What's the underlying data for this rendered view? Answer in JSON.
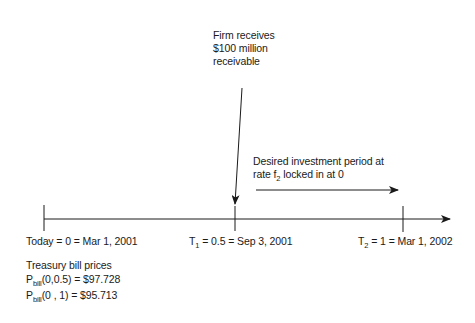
{
  "annotations": {
    "firm_receives": [
      "Firm receives",
      "$100 million",
      "receivable"
    ],
    "investment_period": {
      "line1": "Desired investment period at",
      "line2_prefix": "rate f",
      "line2_sub": "2",
      "line2_suffix": " locked in at 0"
    }
  },
  "timeline": {
    "points": [
      {
        "label": "Today = 0 = Mar 1, 2001"
      },
      {
        "prefix": "T",
        "sub": "1",
        "suffix": " = 0.5 = Sep 3, 2001"
      },
      {
        "prefix": "T",
        "sub": "2",
        "suffix": " = 1 = Mar 1, 2002"
      }
    ]
  },
  "prices": {
    "title": "Treasury bill prices",
    "rows": [
      {
        "prefix": "P",
        "sub": "bill",
        "suffix": "(0,0.5) = $97.728"
      },
      {
        "prefix": "P",
        "sub": "bill",
        "suffix": "(0 , 1) = $95.713"
      }
    ]
  },
  "colors": {
    "line": "#1a1a1a",
    "background": "#ffffff"
  }
}
